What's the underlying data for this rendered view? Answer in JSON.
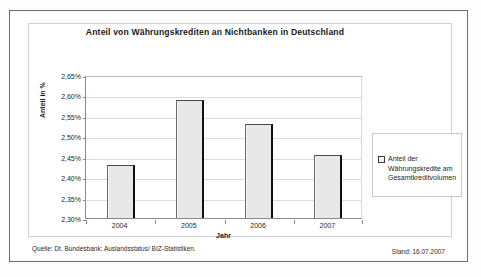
{
  "figure": {
    "title": "Anteil von Währungskrediten an Nichtbanken in Deutschland",
    "source_note": "Quelle: Dt. Bundesbank: Auslandsstatus/ BIZ-Statistiken.",
    "status_note": "Stand: 16.07.2007",
    "legend_swatch_icon": "square-swatch-icon"
  },
  "chart_data": {
    "type": "bar",
    "title": "Anteil von Währungskrediten an Nichtbanken in Deutschland",
    "xlabel": "Jahr",
    "ylabel": "Anteil in %",
    "categories": [
      "2004",
      "2005",
      "2006",
      "2007"
    ],
    "values": [
      2.43,
      2.59,
      2.53,
      2.455
    ],
    "value_labels": [
      "2,43%",
      "2,59%",
      "2,53%",
      "2,46%"
    ],
    "series": [
      {
        "name": "Anteil der Währungskredite am Gesamtkreditvolumen",
        "values": [
          2.43,
          2.59,
          2.53,
          2.455
        ]
      }
    ],
    "ylim": [
      2.3,
      2.65
    ],
    "ytick_step": 0.05,
    "ytick_labels": [
      "2,65%",
      "2,60%",
      "2,55%",
      "2,50%",
      "2,45%",
      "2,40%",
      "2,35%",
      "2,30%"
    ],
    "ytick_values": [
      2.65,
      2.6,
      2.55,
      2.5,
      2.45,
      2.4,
      2.35,
      2.3
    ],
    "grid": true,
    "legend_position": "right",
    "legend_entries": [
      "Anteil der Währungskredite am Gesamtkreditvolumen"
    ],
    "bar_color": "#e8e8e8",
    "bar_edge_color": "#111111",
    "grid_color": "#dcdcdc"
  }
}
